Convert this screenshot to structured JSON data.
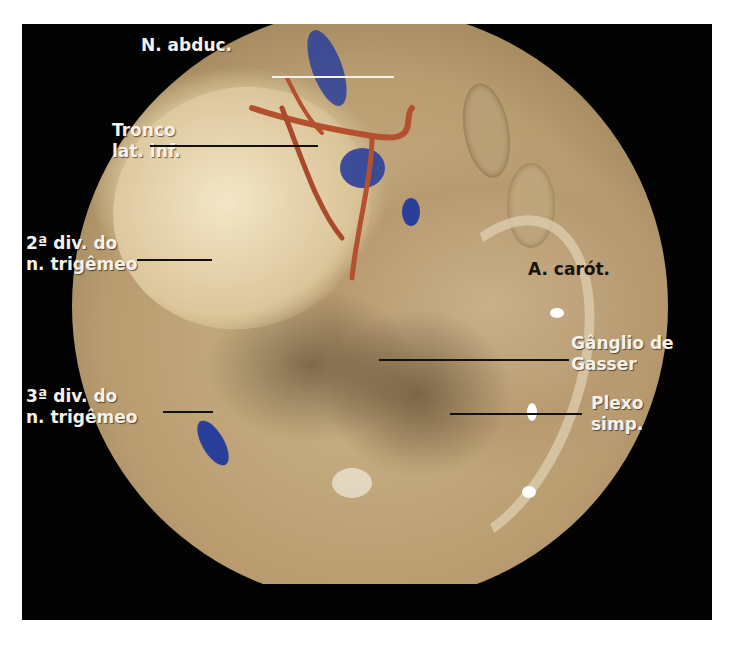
{
  "figure": {
    "type": "endoscopic anatomical photograph",
    "frame_color": "#030303",
    "page_background": "#ffffff",
    "labels": [
      {
        "id": "n-abduc",
        "lines": [
          "N. abduc."
        ],
        "color": "#f4f1ea"
      },
      {
        "id": "tronco-lat-inf",
        "lines": [
          "Tronco",
          "lat. inf."
        ],
        "color": "#f4f1ea"
      },
      {
        "id": "2a-div",
        "lines": [
          "2ª div. do",
          "n. trigêmeo"
        ],
        "color": "#f4f1ea"
      },
      {
        "id": "a-carot",
        "lines": [
          "A. carót."
        ],
        "color": "#1a140c"
      },
      {
        "id": "ganglio-gasser",
        "lines": [
          "Gânglio de",
          "Gasser"
        ],
        "color": "#f4f1ea"
      },
      {
        "id": "3a-div",
        "lines": [
          "3ª div. do",
          "n. trigêmeo"
        ],
        "color": "#f4f1ea"
      },
      {
        "id": "plexo-simp",
        "lines": [
          "Plexo",
          "simp."
        ],
        "color": "#f4f1ea"
      }
    ],
    "tissue_colors": {
      "pale_nerve": "#efe0bd",
      "dura": "#c8b08a",
      "artery_red": "#b5502f",
      "stain_blue": "#2a3f9a",
      "highlight": "#ffffff"
    }
  }
}
